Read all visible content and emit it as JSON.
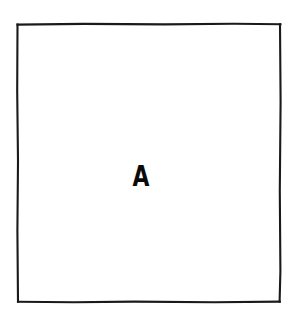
{
  "figure": {
    "type": "line-drawing",
    "background_color": "#ffffff",
    "canvas": {
      "width": 299,
      "height": 321
    },
    "region": {
      "label": "A",
      "label_color": "#0a0a0a",
      "stroke_color": "#1a1a1a",
      "stroke_width": 2,
      "fill_color": "#ffffff",
      "shape": "rectangle",
      "bounds": {
        "x": 17,
        "y": 24,
        "width": 264,
        "height": 278
      },
      "label_position": {
        "x": 140,
        "y": 177
      }
    }
  }
}
